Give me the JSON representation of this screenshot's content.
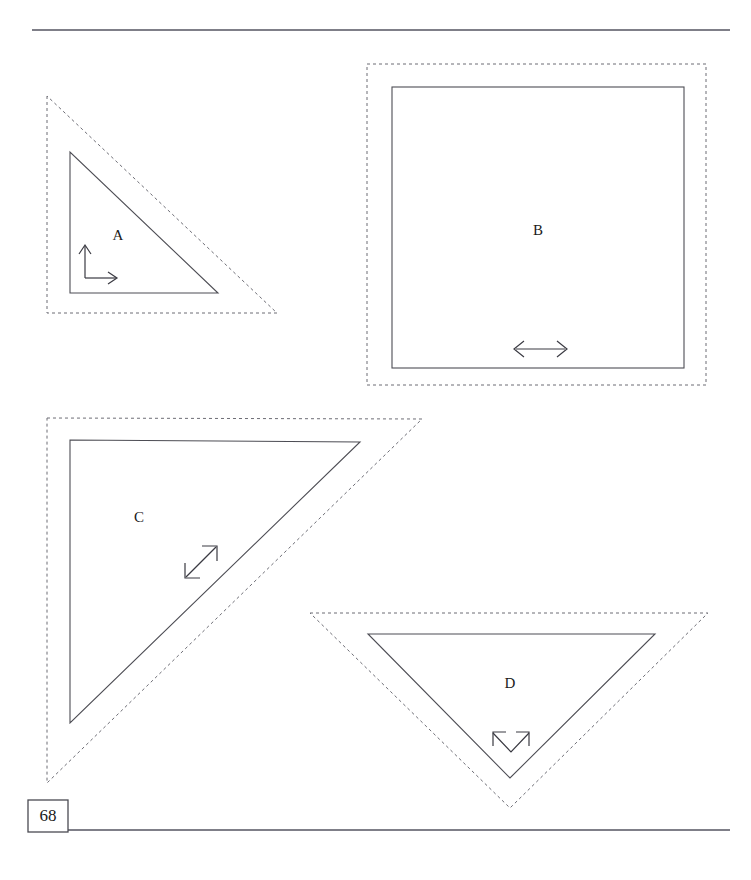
{
  "page": {
    "number": "68",
    "width": 751,
    "height": 880,
    "background_color": "#ffffff",
    "ink_color": "#3a3a42",
    "dotted_color": "#6d6d75"
  },
  "rules": {
    "top": {
      "x1": 32,
      "y1": 30,
      "x2": 730,
      "y2": 30
    },
    "bottom": {
      "x1": 68,
      "y1": 830,
      "x2": 730,
      "y2": 830
    }
  },
  "page_box": {
    "x": 28,
    "y": 800,
    "width": 40,
    "height": 32
  },
  "figures": [
    {
      "id": "A",
      "label": "A",
      "label_x": 118,
      "label_y": 237,
      "solid": {
        "type": "triangle",
        "points": "70,152 70,293 218,293"
      },
      "dotted": {
        "type": "triangle",
        "points": "47,96 47,313 277,313"
      },
      "arrow": {
        "type": "corner-double-arrow",
        "description": "vertical arrow up and horizontal arrow right meeting at a corner"
      }
    },
    {
      "id": "B",
      "label": "B",
      "label_x": 538,
      "label_y": 232,
      "solid": {
        "type": "rect",
        "x": 392,
        "y": 87,
        "width": 292,
        "height": 281
      },
      "dotted": {
        "type": "rect",
        "x": 367,
        "y": 64,
        "width": 339,
        "height": 321
      },
      "arrow": {
        "type": "horizontal-double-arrow",
        "description": "double-headed arrow pointing left and right"
      }
    },
    {
      "id": "C",
      "label": "C",
      "label_x": 139,
      "label_y": 519,
      "solid": {
        "type": "triangle",
        "points": "70,440 360,442 70,723"
      },
      "dotted": {
        "type": "triangle",
        "points": "47,418 422,419 47,783"
      },
      "arrow": {
        "type": "diagonal-double-arrow",
        "description": "double-headed arrow pointing up-right and down-left"
      }
    },
    {
      "id": "D",
      "label": "D",
      "label_x": 510,
      "label_y": 685,
      "solid": {
        "type": "triangle",
        "points": "368,634 655,634 510,778"
      },
      "dotted": {
        "type": "triangle",
        "points": "310,613 708,613 510,808"
      },
      "arrow": {
        "type": "chevron-double-arrow",
        "description": "V-shaped double-headed arrow with heads at the upper ends"
      }
    }
  ]
}
